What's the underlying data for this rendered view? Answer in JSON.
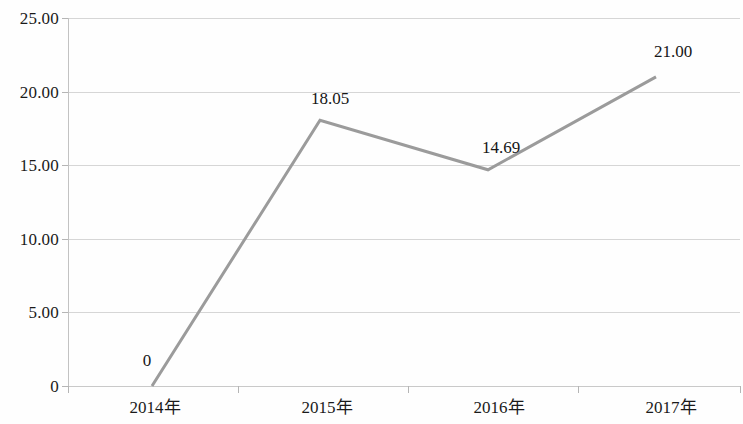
{
  "chart_data": {
    "type": "line",
    "title": "",
    "subtitle": "",
    "xlabel": "",
    "ylabel": "",
    "categories": [
      "2014年",
      "2015年",
      "2016年",
      "2017年"
    ],
    "values": [
      0,
      18.05,
      14.69,
      21.0
    ],
    "point_labels": [
      "0",
      "18.05",
      "14.69",
      "21.00"
    ],
    "series": [
      {
        "name": "",
        "values": [
          0,
          18.05,
          14.69,
          21.0
        ],
        "color": "#9b9b9b",
        "marker": "none",
        "line_width": 3
      }
    ],
    "ylim": [
      0,
      25
    ],
    "ytick_values": [
      0,
      5,
      10,
      15,
      20,
      25
    ],
    "ytick_labels": [
      "0",
      "5.00",
      "10.00",
      "15.00",
      "20.00",
      "25.00"
    ],
    "grid": {
      "horizontal": true,
      "vertical": false,
      "color": "#d6d6d6"
    },
    "legend": {
      "visible": false,
      "position": "none",
      "entries": []
    },
    "axis": {
      "y_axis_line_color": "#c2c2c2",
      "x_axis_line_color": "#c9c9c9",
      "tick_color": "#b5b5b5"
    },
    "background_color": "#fefefe",
    "data_labels_visible": true
  },
  "axes": {
    "y_ticks": [
      {
        "label": "25.00",
        "value": 25
      },
      {
        "label": "20.00",
        "value": 20
      },
      {
        "label": "15.00",
        "value": 15
      },
      {
        "label": "10.00",
        "value": 10
      },
      {
        "label": "5.00",
        "value": 5
      },
      {
        "label": "0",
        "value": 0
      }
    ],
    "x_ticks": [
      {
        "label": "2014年"
      },
      {
        "label": "2015年"
      },
      {
        "label": "2016年"
      },
      {
        "label": "2017年"
      }
    ]
  },
  "points": [
    {
      "label": "0",
      "category": "2014年",
      "value": 0
    },
    {
      "label": "18.05",
      "category": "2015年",
      "value": 18.05
    },
    {
      "label": "14.69",
      "category": "2016年",
      "value": 14.69
    },
    {
      "label": "21.00",
      "category": "2017年",
      "value": 21.0
    }
  ]
}
